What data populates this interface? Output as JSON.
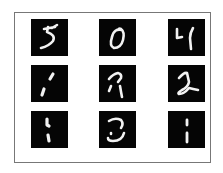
{
  "figure": {
    "frame_border_color": "#777777",
    "background_color": "#ffffff",
    "cell_background": "#050505",
    "stroke_color": "#f2f2f2",
    "grid": {
      "rows": 3,
      "cols": 3
    },
    "cells": [
      {
        "row": 0,
        "col": 0,
        "x": 31,
        "y": 19,
        "digit_shape": "5",
        "stroke_width": 2.6,
        "path": "M13 10 L24 8 M17 8 L16 13 M16 13 Q25 16 22 22 Q18 27 10 29 M21 9 L26 6"
      },
      {
        "row": 0,
        "col": 1,
        "x": 99,
        "y": 19,
        "digit_shape": "0",
        "stroke_width": 2.6,
        "path": "M23 11 Q15 9 13 18 Q10 27 15 29 Q22 29 24 21 Q26 13 22 10 Q20 9 19 11"
      },
      {
        "row": 0,
        "col": 2,
        "x": 168,
        "y": 19,
        "digit_shape": "4",
        "stroke_width": 2.6,
        "path": "M9 10 L9 19 L14 18 M25 9 Q22 14 22 19 L23 30"
      },
      {
        "row": 1,
        "col": 0,
        "x": 31,
        "y": 65,
        "digit_shape": "1",
        "stroke_width": 3.2,
        "path": "M22 9 L19 14 M13 24 L11 30"
      },
      {
        "row": 1,
        "col": 1,
        "x": 99,
        "y": 65,
        "digit_shape": "7",
        "stroke_width": 2.6,
        "path": "M10 14 Q14 9 19 8 Q23 9 22 13 L19 17 M12 21 L10 26 M21 21 Q22 27 23 32"
      },
      {
        "row": 1,
        "col": 2,
        "x": 168,
        "y": 65,
        "digit_shape": "2",
        "stroke_width": 2.6,
        "path": "M11 13 Q16 7 19 8 L21 17 Q20 22 14 25 Q9 28 11 29 Q16 29 21 23 Q25 24 30 25"
      },
      {
        "row": 2,
        "col": 0,
        "x": 31,
        "y": 111,
        "digit_shape": "1",
        "stroke_width": 3.2,
        "path": "M16 8 L16 14 L18 15 M17 24 L18 30"
      },
      {
        "row": 2,
        "col": 1,
        "x": 99,
        "y": 111,
        "digit_shape": "3",
        "stroke_width": 2.6,
        "path": "M10 10 Q16 6 22 9 Q25 13 22 17 M25 22 Q23 30 14 30 Q9 30 9 27 M12 22 L12 23"
      },
      {
        "row": 2,
        "col": 2,
        "x": 168,
        "y": 111,
        "digit_shape": "1",
        "stroke_width": 2.8,
        "path": "M19 9 L19 14 M19 22 L19 31"
      }
    ]
  }
}
